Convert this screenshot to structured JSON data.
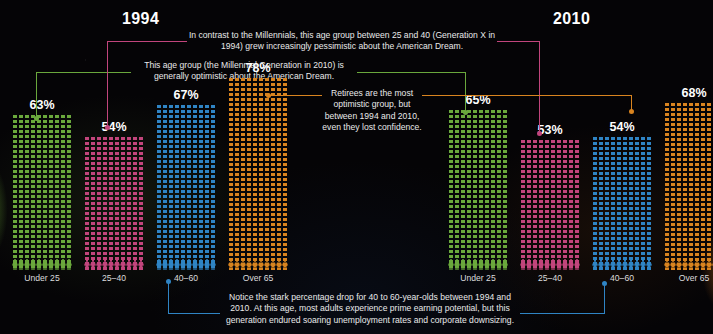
{
  "colors": {
    "green": "#6aa83c",
    "pink": "#c2457c",
    "blue": "#2f84c4",
    "orange": "#d9841f",
    "background": "#050406",
    "text": "#e9e9ea"
  },
  "headers": {
    "left_year": "1994",
    "right_year": "2010"
  },
  "annotations": {
    "genx": "In contrast to the Millennials, this age group between 25 and 40 (Generation X in 1994) grew increasingly pessimistic about the American Dream.",
    "millennial": "This age group (the Millennial Generation in 2010) is generally optimistic about the American Dream.",
    "retirees": "Retirees are the most optimistic group, but between 1994 and 2010, even they lost confidence.",
    "bottom": "Notice the stark percentage drop for 40 to 60-year-olds between 1994 and 2010. At this age, most adults experience prime earning potential, but this generation endured soaring unemployment rates and corporate downsizing."
  },
  "chart_data": {
    "type": "bar",
    "xlabel": "",
    "ylabel": "Percent optimistic about the American Dream",
    "ylim": [
      0,
      100
    ],
    "categories": [
      "Under 25",
      "25–40",
      "40–60",
      "Over 65"
    ],
    "series": [
      {
        "name": "1994",
        "values": [
          63,
          54,
          67,
          78
        ],
        "labels": [
          "63%",
          "54%",
          "67%",
          "78%"
        ]
      },
      {
        "name": "2010",
        "values": [
          65,
          53,
          54,
          68
        ],
        "labels": [
          "65%",
          "53%",
          "54%",
          "68%"
        ]
      }
    ],
    "series_colors": [
      "#6aa83c",
      "#c2457c",
      "#2f84c4",
      "#d9841f"
    ],
    "grid": false,
    "legend": "none",
    "units": "percent"
  }
}
